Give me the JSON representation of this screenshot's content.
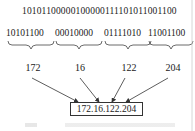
{
  "diagram": {
    "binary_full": "10101100000010000001111010110011 00",
    "binary_string": "10101100000100000111101011001100",
    "octets_binary": [
      "10101100",
      "00010000",
      "01111010",
      "11001100"
    ],
    "octets_decimal": [
      "172",
      "16",
      "122",
      "204"
    ],
    "result_ip": "172.16.122.204"
  },
  "colors": {
    "ink": "#1a1a1a",
    "line": "#333333",
    "background": "#ffffff"
  }
}
